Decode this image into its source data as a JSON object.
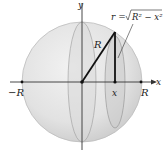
{
  "diagram": {
    "axes": {
      "x_label": "x",
      "y_label": "y"
    },
    "points": {
      "neg_R": "−R",
      "pos_R": "R",
      "x": "x"
    },
    "radius_label": "R",
    "formula": {
      "lhs": "r = ",
      "radicand": "R² − x²"
    },
    "colors": {
      "sphere_fill": "#e4e4e4",
      "sphere_shade": "#cfcfcf",
      "disk_fill": "#d4d4d4",
      "line": "#111111",
      "axis": "#333333"
    }
  }
}
